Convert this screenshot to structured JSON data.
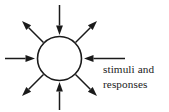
{
  "figure": {
    "kind": "stimuli-response-diagram",
    "background_color": "#ffffff",
    "ink_color": "#1a1a1a",
    "width": 169,
    "height": 112
  },
  "node": {
    "label": "",
    "shape": "circle",
    "center_x": 59.5,
    "center_y": 58.5,
    "radius": 22,
    "fill_color": "#ffffff",
    "stroke_color": "#1a1a1a"
  },
  "caption": {
    "line1": "stimuli and",
    "line2": "responses",
    "x": 103,
    "line1_baseline": 73,
    "line2_baseline": 88,
    "color": "#1a1a1a"
  },
  "arrows": [
    {
      "name": "arrow-top-inward",
      "direction": "inward",
      "angle_deg": 270,
      "tail_x": 59.5,
      "tail_y": 5,
      "tip_x": 59.5,
      "tip_y": 35
    },
    {
      "name": "arrow-top-right-outward",
      "direction": "outward",
      "angle_deg": 315,
      "tail_x": 75.5,
      "tail_y": 42.5,
      "tip_x": 97,
      "tip_y": 21
    },
    {
      "name": "arrow-right-inward",
      "direction": "inward",
      "angle_deg": 0,
      "tail_x": 125,
      "tail_y": 58.5,
      "tip_x": 84,
      "tip_y": 58.5
    },
    {
      "name": "arrow-bottom-right-outward",
      "direction": "outward",
      "angle_deg": 45,
      "tail_x": 75.5,
      "tail_y": 74.5,
      "tip_x": 97,
      "tip_y": 96
    },
    {
      "name": "arrow-bottom-inward",
      "direction": "inward",
      "angle_deg": 90,
      "tail_x": 59.5,
      "tail_y": 110,
      "tip_x": 59.5,
      "tip_y": 82
    },
    {
      "name": "arrow-bottom-left-outward",
      "direction": "outward",
      "angle_deg": 135,
      "tail_x": 43.5,
      "tail_y": 74.5,
      "tip_x": 22,
      "tip_y": 96
    },
    {
      "name": "arrow-left-inward",
      "direction": "inward",
      "angle_deg": 180,
      "tail_x": 5,
      "tail_y": 58.5,
      "tip_x": 35,
      "tip_y": 58.5
    },
    {
      "name": "arrow-top-left-outward",
      "direction": "outward",
      "angle_deg": 225,
      "tail_x": 43.5,
      "tail_y": 42.5,
      "tip_x": 22,
      "tip_y": 21
    }
  ]
}
